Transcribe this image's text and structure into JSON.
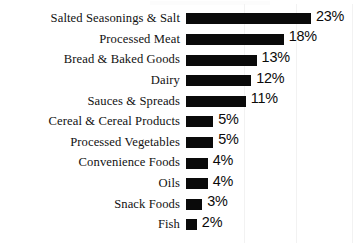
{
  "chart_data": {
    "type": "bar",
    "orientation": "horizontal",
    "title": "",
    "subtitle": "",
    "xlabel": "",
    "ylabel": "",
    "grid": true,
    "legend": false,
    "legend_position": "none",
    "value_suffix": "%",
    "xlim": [
      0,
      23
    ],
    "bar_color": "#0a0a0a",
    "background_color": "#ffffff",
    "gridline_color": "#f2f2f2",
    "gridline_positions": [
      244,
      296,
      352
    ],
    "categories": [
      "Salted Seasonings & Salt",
      "Processed Meat",
      "Bread & Baked Goods",
      "Dairy",
      "Sauces & Spreads",
      "Cereal & Cereal Products",
      "Processed Vegetables",
      "Convenience Foods",
      "Oils",
      "Snack Foods",
      "Fish"
    ],
    "values": [
      23,
      18,
      13,
      12,
      11,
      5,
      5,
      4,
      4,
      3,
      2
    ],
    "value_labels": [
      "23%",
      "18%",
      "13%",
      "12%",
      "11%",
      "5%",
      "5%",
      "4%",
      "4%",
      "3%",
      "2%"
    ]
  }
}
